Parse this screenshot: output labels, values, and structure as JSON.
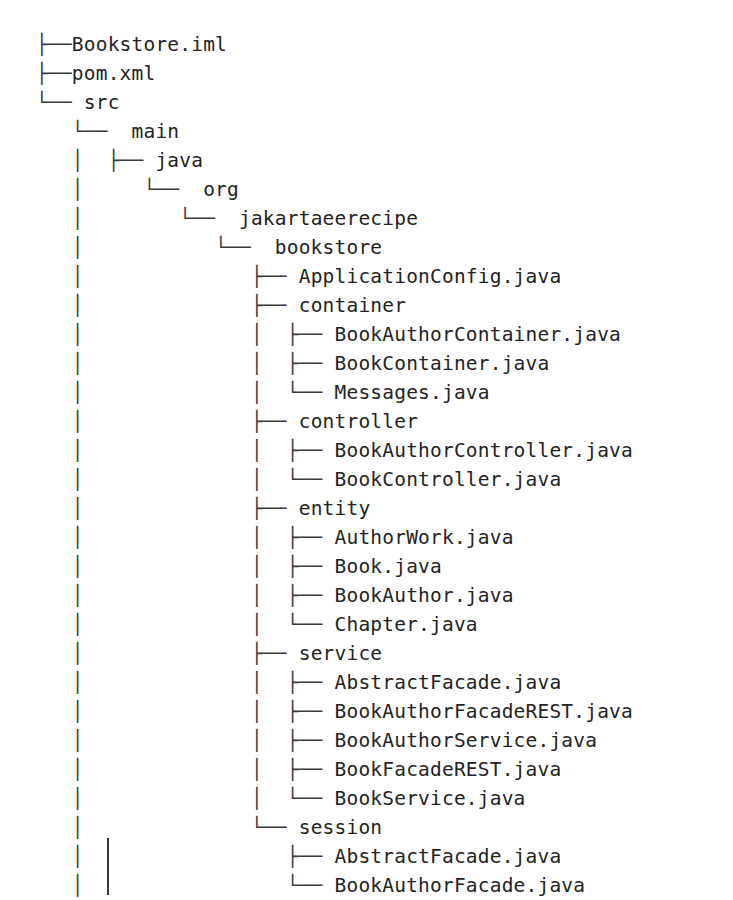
{
  "view": {
    "kind": "directory-tree-listing",
    "background_color": "#ffffff",
    "text_color": "#2b2b2b",
    "connector_color": "#3a3a3a",
    "root_name": "Bookstore",
    "truncated": true,
    "geometry": {
      "indent_px": 49.5,
      "row_height_px": 29,
      "first_row_top_px": 30,
      "base_left_px": 36,
      "continuation_rule": {
        "x": 107,
        "y": 838,
        "height": 57
      }
    }
  },
  "glyphs": {
    "tee": "├──",
    "elbow": "└──",
    "pipe": "│",
    "blank": "   "
  },
  "rows": [
    {
      "indent": 0,
      "connector": "tee",
      "ancestors": [],
      "label": "Bookstore.iml",
      "type": "file"
    },
    {
      "indent": 0,
      "connector": "tee",
      "ancestors": [],
      "label": "pom.xml",
      "type": "file"
    },
    {
      "indent": 0,
      "connector": "elbow",
      "ancestors": [],
      "label": " src",
      "type": "dir"
    },
    {
      "indent": 1,
      "connector": "elbow",
      "ancestors": [
        "blank"
      ],
      "label": "  main",
      "type": "dir"
    },
    {
      "indent": 2,
      "connector": "tee",
      "ancestors": [
        "blank",
        "pipe"
      ],
      "label": " java",
      "type": "dir"
    },
    {
      "indent": 3,
      "connector": "elbow",
      "ancestors": [
        "blank",
        "pipe",
        "blank"
      ],
      "label": "  org",
      "type": "dir"
    },
    {
      "indent": 4,
      "connector": "elbow",
      "ancestors": [
        "blank",
        "pipe",
        "blank",
        "blank"
      ],
      "label": "  jakartaeerecipe",
      "type": "dir"
    },
    {
      "indent": 5,
      "connector": "elbow",
      "ancestors": [
        "blank",
        "pipe",
        "blank",
        "blank",
        "blank"
      ],
      "label": "  bookstore",
      "type": "dir"
    },
    {
      "indent": 6,
      "connector": "tee",
      "ancestors": [
        "blank",
        "pipe",
        "blank",
        "blank",
        "blank",
        "blank"
      ],
      "label": " ApplicationConfig.java",
      "type": "file"
    },
    {
      "indent": 6,
      "connector": "tee",
      "ancestors": [
        "blank",
        "pipe",
        "blank",
        "blank",
        "blank",
        "blank"
      ],
      "label": " container",
      "type": "dir"
    },
    {
      "indent": 7,
      "connector": "tee",
      "ancestors": [
        "blank",
        "pipe",
        "blank",
        "blank",
        "blank",
        "blank",
        "pipe"
      ],
      "label": " BookAuthorContainer.java",
      "type": "file"
    },
    {
      "indent": 7,
      "connector": "tee",
      "ancestors": [
        "blank",
        "pipe",
        "blank",
        "blank",
        "blank",
        "blank",
        "pipe"
      ],
      "label": " BookContainer.java",
      "type": "file"
    },
    {
      "indent": 7,
      "connector": "elbow",
      "ancestors": [
        "blank",
        "pipe",
        "blank",
        "blank",
        "blank",
        "blank",
        "pipe"
      ],
      "label": " Messages.java",
      "type": "file"
    },
    {
      "indent": 6,
      "connector": "tee",
      "ancestors": [
        "blank",
        "pipe",
        "blank",
        "blank",
        "blank",
        "blank"
      ],
      "label": " controller",
      "type": "dir"
    },
    {
      "indent": 7,
      "connector": "tee",
      "ancestors": [
        "blank",
        "pipe",
        "blank",
        "blank",
        "blank",
        "blank",
        "pipe"
      ],
      "label": " BookAuthorController.java",
      "type": "file"
    },
    {
      "indent": 7,
      "connector": "elbow",
      "ancestors": [
        "blank",
        "pipe",
        "blank",
        "blank",
        "blank",
        "blank",
        "pipe"
      ],
      "label": " BookController.java",
      "type": "file"
    },
    {
      "indent": 6,
      "connector": "tee",
      "ancestors": [
        "blank",
        "pipe",
        "blank",
        "blank",
        "blank",
        "blank"
      ],
      "label": " entity",
      "type": "dir"
    },
    {
      "indent": 7,
      "connector": "tee",
      "ancestors": [
        "blank",
        "pipe",
        "blank",
        "blank",
        "blank",
        "blank",
        "pipe"
      ],
      "label": " AuthorWork.java",
      "type": "file"
    },
    {
      "indent": 7,
      "connector": "tee",
      "ancestors": [
        "blank",
        "pipe",
        "blank",
        "blank",
        "blank",
        "blank",
        "pipe"
      ],
      "label": " Book.java",
      "type": "file"
    },
    {
      "indent": 7,
      "connector": "tee",
      "ancestors": [
        "blank",
        "pipe",
        "blank",
        "blank",
        "blank",
        "blank",
        "pipe"
      ],
      "label": " BookAuthor.java",
      "type": "file"
    },
    {
      "indent": 7,
      "connector": "elbow",
      "ancestors": [
        "blank",
        "pipe",
        "blank",
        "blank",
        "blank",
        "blank",
        "pipe"
      ],
      "label": " Chapter.java",
      "type": "file"
    },
    {
      "indent": 6,
      "connector": "tee",
      "ancestors": [
        "blank",
        "pipe",
        "blank",
        "blank",
        "blank",
        "blank"
      ],
      "label": " service",
      "type": "dir"
    },
    {
      "indent": 7,
      "connector": "tee",
      "ancestors": [
        "blank",
        "pipe",
        "blank",
        "blank",
        "blank",
        "blank",
        "pipe"
      ],
      "label": " AbstractFacade.java",
      "type": "file"
    },
    {
      "indent": 7,
      "connector": "tee",
      "ancestors": [
        "blank",
        "pipe",
        "blank",
        "blank",
        "blank",
        "blank",
        "pipe"
      ],
      "label": " BookAuthorFacadeREST.java",
      "type": "file"
    },
    {
      "indent": 7,
      "connector": "tee",
      "ancestors": [
        "blank",
        "pipe",
        "blank",
        "blank",
        "blank",
        "blank",
        "pipe"
      ],
      "label": " BookAuthorService.java",
      "type": "file"
    },
    {
      "indent": 7,
      "connector": "tee",
      "ancestors": [
        "blank",
        "pipe",
        "blank",
        "blank",
        "blank",
        "blank",
        "pipe"
      ],
      "label": " BookFacadeREST.java",
      "type": "file"
    },
    {
      "indent": 7,
      "connector": "elbow",
      "ancestors": [
        "blank",
        "pipe",
        "blank",
        "blank",
        "blank",
        "blank",
        "pipe"
      ],
      "label": " BookService.java",
      "type": "file"
    },
    {
      "indent": 6,
      "connector": "elbow",
      "ancestors": [
        "blank",
        "pipe",
        "blank",
        "blank",
        "blank",
        "blank"
      ],
      "label": " session",
      "type": "dir"
    },
    {
      "indent": 7,
      "connector": "tee",
      "ancestors": [
        "blank",
        "pipe",
        "blank",
        "blank",
        "blank",
        "blank",
        "blank"
      ],
      "label": " AbstractFacade.java",
      "type": "file"
    },
    {
      "indent": 7,
      "connector": "elbow",
      "ancestors": [
        "blank",
        "pipe",
        "blank",
        "blank",
        "blank",
        "blank",
        "blank"
      ],
      "label": " BookAuthorFacade.java",
      "type": "file"
    }
  ]
}
